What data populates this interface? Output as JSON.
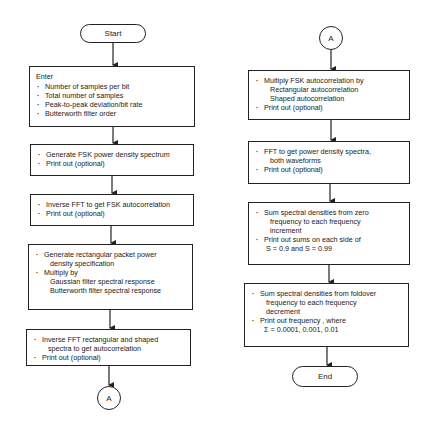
{
  "left_column": {
    "start": {
      "label": "Start"
    },
    "enter_box": {
      "title": "Enter",
      "items": [
        "Number of samples per bit",
        "Total number of samples",
        "Peak-to-peak deviation/bit rate",
        "Butterworth filter order"
      ]
    },
    "generate_fsk_box": {
      "items": [
        "Generate FSK power density spectrum",
        "Print out (optional)"
      ]
    },
    "inverse_fft_fsk_box": {
      "items": [
        "Inverse FFT to get FSK autocorrelation",
        "Print out (optional)"
      ]
    },
    "generate_rect_box": {
      "item1": "Generate rectangular packet power",
      "item1_cont": "density specification",
      "item2": "Multiply by",
      "item2_sub": [
        "Gaussian filter spectral response",
        "Butterworth filter spectral response"
      ]
    },
    "inverse_fft_rect_box": {
      "item1": "Inverse FFT rectangular and shaped",
      "item1_cont": "spectra to get autocorrelation",
      "item2": "Print out (optional)"
    },
    "connector": {
      "label": "A"
    }
  },
  "right_column": {
    "connector": {
      "label": "A"
    },
    "multiply_box": {
      "item1": "Multiply FSK autocorrelation by",
      "item1_sub": [
        "Rectangular autocorrelation",
        "Shaped autocorrelation"
      ],
      "item2": "Print out (optional)"
    },
    "fft_box": {
      "item1": "FFT to get power density spectra,",
      "item1_cont": "both waveforms",
      "item2": "Print out (optional)"
    },
    "sum_zero_box": {
      "item1": "Sum spectral densities from zero",
      "item1_cont": [
        "frequency to each frequency",
        "increment"
      ],
      "item2": "Print out sums on each side of",
      "item2_cont": "S = 0.9 and S = 0.99"
    },
    "sum_foldover_box": {
      "item1": "Sum spectral densities from foldover",
      "item1_cont": [
        "frequency to each frequency",
        "decrement"
      ],
      "item2": "Print out frequency , where",
      "item2_cont": "Σ = 0.0001, 0.001, 0.01"
    },
    "end": {
      "label": "End"
    }
  }
}
